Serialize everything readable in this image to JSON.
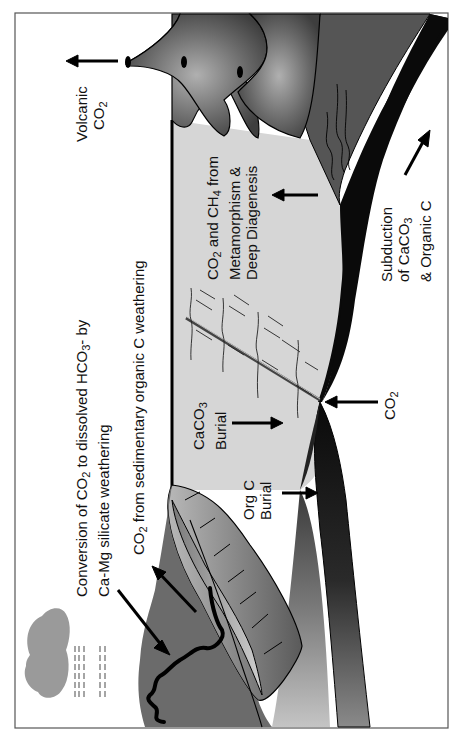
{
  "figure": {
    "orientation": "rotated-90-ccw",
    "colors": {
      "background": "#ffffff",
      "frame": "#555555",
      "ocean_sediment": "#d6d6d6",
      "volcano_dark": "#4a4a4a",
      "volcano_glow": "#a8a8a8",
      "continent": "#6b6b6b",
      "slab": "#0a0a0a",
      "cloud": "#9a9a9a"
    }
  },
  "labels": {
    "volcanic": {
      "line1": "Volcanic",
      "line2_main": "CO",
      "line2_sub": "2"
    },
    "conversion": {
      "line1_a": "Conversion of CO",
      "line1_sub": "2",
      "line1_b": " to dissolved HCO",
      "line1_sub2": "3",
      "line1_c": "- by",
      "line2": "Ca-Mg silicate weathering"
    },
    "organic_weathering": {
      "pre": "CO",
      "sub": "2",
      "post": " from sedimentary organic C weathering"
    },
    "metamorphism": {
      "line1_a": "CO",
      "line1_sub": "2",
      "line1_b": " and CH",
      "line1_sub2": "4",
      "line1_c": " from",
      "line2": "Metamorphism &",
      "line3": "Deep Diagenesis"
    },
    "caco3_burial": {
      "line1_a": "CaCO",
      "line1_sub": "3",
      "line2": "Burial"
    },
    "org_c_burial": {
      "line1": "Org C",
      "line2": "Burial"
    },
    "subduction": {
      "line1": "Subduction",
      "line2_a": "of CaCO",
      "line2_sub": "3",
      "line3": "& Organic C"
    },
    "trench_co2": {
      "main": "CO",
      "sub": "2"
    }
  }
}
